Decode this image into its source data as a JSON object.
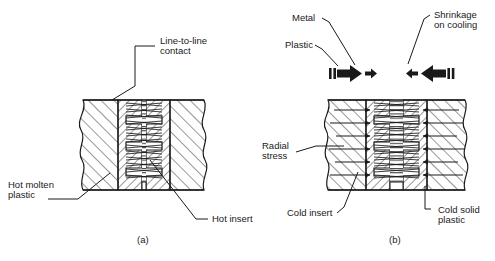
{
  "figure": {
    "title_alt": "Cross-section of threaded metal insert in plastic: (a) hot molten plastic around hot insert, (b) cold solid plastic shrinking onto cold insert",
    "background_color": "#ffffff",
    "line_color": "#1a1a1a"
  },
  "panel_a": {
    "caption": "(a)",
    "labels": {
      "line_to_line": "Line-to-line\ncontact",
      "line_to_line_l1": "Line-to-line",
      "line_to_line_l2": "contact",
      "hot_molten_plastic_l1": "Hot molten",
      "hot_molten_plastic_l2": "plastic",
      "hot_insert": "Hot insert"
    }
  },
  "panel_b": {
    "caption": "(b)",
    "labels": {
      "metal": "Metal",
      "plastic": "Plastic",
      "shrinkage_l1": "Shrinkage",
      "shrinkage_l2": "on cooling",
      "radial_stress_l1": "Radial",
      "radial_stress_l2": "stress",
      "cold_insert": "Cold insert",
      "cold_solid_plastic_l1": "Cold solid",
      "cold_solid_plastic_l2": "plastic"
    },
    "arrow_glyphs": {
      "left_group": "bars-then-big-right-arrow-then-small-right-arrow",
      "right_group": "small-left-arrow-then-big-left-arrow-then-bars"
    }
  }
}
